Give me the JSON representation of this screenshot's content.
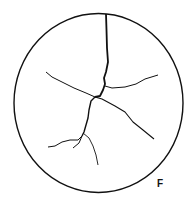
{
  "figure": {
    "label": "F",
    "stroke_color": "#111111",
    "background_color": "#ffffff"
  }
}
